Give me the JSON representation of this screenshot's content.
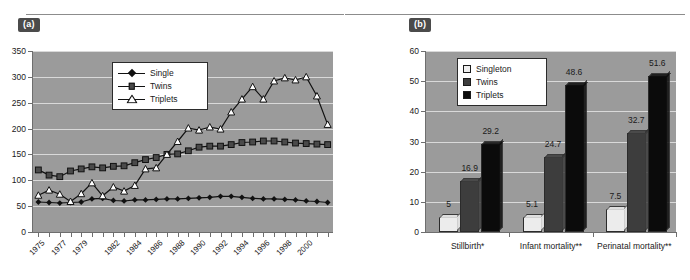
{
  "figure": {
    "panel_a_tag": "(a)",
    "panel_b_tag": "(b)"
  },
  "chart_data": [
    {
      "type": "line",
      "panel": "(a)",
      "title": "",
      "xlabel": "",
      "ylabel": "",
      "ylim": [
        0,
        350
      ],
      "yticks": [
        0,
        50,
        100,
        150,
        200,
        250,
        300,
        350
      ],
      "xtick_labels": [
        "1975",
        "1977",
        "1979",
        "1982",
        "1984",
        "1986",
        "1988",
        "1990",
        "1992",
        "1994",
        "1996",
        "1998",
        "2000"
      ],
      "grid": true,
      "legend_position": "upper-left-inside",
      "x": [
        1975,
        1976,
        1977,
        1978,
        1979,
        1980,
        1981,
        1982,
        1983,
        1984,
        1985,
        1986,
        1987,
        1988,
        1989,
        1990,
        1991,
        1992,
        1993,
        1994,
        1995,
        1996,
        1997,
        1998,
        1999,
        2000,
        2001,
        2002
      ],
      "series": [
        {
          "name": "Single",
          "marker": "diamond",
          "values": [
            58,
            57,
            56,
            57,
            58,
            64,
            65,
            61,
            60,
            62,
            62,
            63,
            64,
            64,
            65,
            66,
            67,
            69,
            69,
            67,
            65,
            64,
            64,
            63,
            62,
            60,
            59,
            57
          ]
        },
        {
          "name": "Twins",
          "marker": "square",
          "values": [
            120,
            110,
            107,
            118,
            122,
            126,
            124,
            127,
            128,
            134,
            140,
            144,
            150,
            151,
            157,
            164,
            166,
            166,
            169,
            173,
            174,
            176,
            176,
            174,
            172,
            171,
            170,
            169
          ]
        },
        {
          "name": "Triplets",
          "marker": "triangle",
          "values": [
            71,
            81,
            73,
            59,
            74,
            95,
            70,
            87,
            79,
            90,
            122,
            124,
            150,
            175,
            201,
            197,
            203,
            199,
            232,
            257,
            281,
            257,
            292,
            298,
            294,
            300,
            263,
            208
          ]
        }
      ]
    },
    {
      "type": "bar",
      "panel": "(b)",
      "title": "",
      "xlabel": "",
      "ylabel": "",
      "ylim": [
        0,
        60
      ],
      "yticks": [
        0,
        10,
        20,
        30,
        40,
        50,
        60
      ],
      "grid": true,
      "legend_position": "upper-left-inside",
      "categories": [
        "Stillbirth*",
        "Infant mortality**",
        "Perinatal mortality**"
      ],
      "series": [
        {
          "name": "Singleton",
          "color": "#ececec",
          "values": [
            5,
            5.1,
            7.5
          ],
          "labels": [
            "5",
            "5.1",
            "7.5"
          ]
        },
        {
          "name": "Twins",
          "color": "#3d3d3d",
          "values": [
            16.9,
            24.7,
            32.7
          ],
          "labels": [
            "16.9",
            "24.7",
            "32.7"
          ]
        },
        {
          "name": "Triplets",
          "color": "#0b0b0b",
          "values": [
            29.2,
            48.6,
            51.6
          ],
          "labels": [
            "29.2",
            "48.6",
            "51.6"
          ]
        }
      ]
    }
  ],
  "colors": {
    "plot_background": "#9b9b9b",
    "gridline": "#d9d9d9",
    "axis": "#6e6e6e",
    "tag_background": "#4b4b4b",
    "singleton": "#ececec",
    "twins": "#3d3d3d",
    "triplets": "#0b0b0b"
  }
}
